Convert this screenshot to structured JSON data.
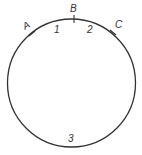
{
  "diagram": {
    "type": "circle-arcs",
    "circle": {
      "cx": 71.5,
      "cy": 83,
      "r": 64,
      "stroke": "#333333",
      "stroke_width": 1.3
    },
    "points": [
      {
        "label": "A",
        "tick": {
          "x1": 29,
          "y1": 36,
          "x2": 35,
          "y2": 31
        },
        "text_x": 23,
        "text_y": 29,
        "rotate": -30
      },
      {
        "label": "B",
        "tick": {
          "x1": 74,
          "y1": 15,
          "x2": 74,
          "y2": 23
        },
        "text_x": 70,
        "text_y": 12,
        "rotate": 0
      },
      {
        "label": "C",
        "tick": {
          "x1": 110,
          "y1": 30,
          "x2": 116,
          "y2": 35
        },
        "text_x": 115,
        "text_y": 28,
        "rotate": 0
      }
    ],
    "arcs": [
      {
        "label": "1",
        "x": 54,
        "y": 33
      },
      {
        "label": "2",
        "x": 87,
        "y": 33
      },
      {
        "label": "3",
        "x": 68,
        "y": 142
      }
    ]
  }
}
